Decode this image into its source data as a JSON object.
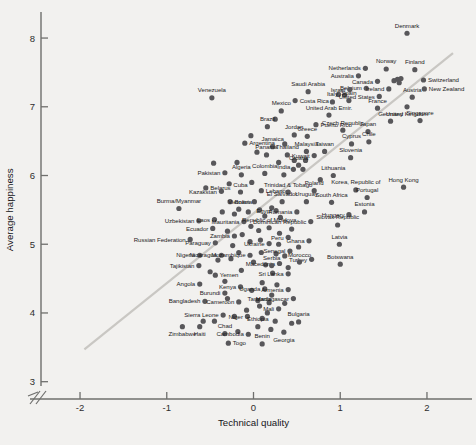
{
  "chart_data": {
    "type": "scatter",
    "title": "",
    "xlabel": "Technical quality",
    "ylabel": "Average happiness",
    "xlim": [
      -2.45,
      2.45
    ],
    "ylim": [
      2.85,
      8.35
    ],
    "xticks": [
      "-2",
      "-1",
      "0",
      "1",
      "2"
    ],
    "xtick_values": [
      -2,
      -1,
      0,
      1,
      2
    ],
    "yticks": [
      "3",
      "4",
      "5",
      "6",
      "7",
      "8"
    ],
    "ytick_values": [
      3,
      4,
      5,
      6,
      7,
      8
    ],
    "grid": false,
    "legend": null,
    "axis_break": "y-axis break near origin (double-slash)",
    "trendline": {
      "type": "linear",
      "x": [
        -1.95,
        2.3
      ],
      "y": [
        3.47,
        7.78
      ]
    },
    "marker_color": "#58575a",
    "trendline_color": "#c9c7c3",
    "points": [
      {
        "label": "Denmark",
        "x": 1.77,
        "y": 8.07,
        "lp": "above"
      },
      {
        "label": "Netherlands",
        "x": 1.29,
        "y": 7.56,
        "lp": "left"
      },
      {
        "label": "Norway",
        "x": 1.53,
        "y": 7.55,
        "lp": "above"
      },
      {
        "label": "Finland",
        "x": 1.86,
        "y": 7.54,
        "lp": "above"
      },
      {
        "label": "Australia",
        "x": 1.21,
        "y": 7.45,
        "lp": "left"
      },
      {
        "label": "Canada",
        "x": 1.43,
        "y": 7.37,
        "lp": "left"
      },
      {
        "label": "Switzerland",
        "x": 1.96,
        "y": 7.39,
        "lp": "right"
      },
      {
        "label": "Belgium",
        "x": 1.3,
        "y": 7.27,
        "lp": "left"
      },
      {
        "label": "Israel",
        "x": 1.11,
        "y": 7.25,
        "lp": "left"
      },
      {
        "label": "Ireland",
        "x": 1.56,
        "y": 7.26,
        "lp": "left"
      },
      {
        "label": "New Zealand",
        "x": 1.97,
        "y": 7.26,
        "lp": "right"
      },
      {
        "label": "United States",
        "x": 1.45,
        "y": 7.15,
        "lp": "left"
      },
      {
        "label": "Austria",
        "x": 1.83,
        "y": 7.14,
        "lp": "above"
      },
      {
        "label": "Spain",
        "x": 1.1,
        "y": 7.09,
        "lp": "above"
      },
      {
        "label": "Italy",
        "x": 0.91,
        "y": 7.07,
        "lp": "above"
      },
      {
        "label": "Costa Rica",
        "x": 0.48,
        "y": 7.09,
        "lp": "right"
      },
      {
        "label": "Venezuela",
        "x": -0.48,
        "y": 7.13,
        "lp": "above"
      },
      {
        "label": "Saudi Arabia",
        "x": 0.63,
        "y": 7.22,
        "lp": "above"
      },
      {
        "label": "France",
        "x": 1.43,
        "y": 6.98,
        "lp": "above"
      },
      {
        "label": "United Kingdom",
        "x": 1.77,
        "y": 7.0,
        "lp": "below"
      },
      {
        "label": "Mexico",
        "x": 0.32,
        "y": 6.94,
        "lp": "above"
      },
      {
        "label": "United Arab Emir.",
        "x": 0.87,
        "y": 6.88,
        "lp": "above"
      },
      {
        "label": "Germany",
        "x": 1.58,
        "y": 6.79,
        "lp": "above"
      },
      {
        "label": "Singapore",
        "x": 1.92,
        "y": 6.8,
        "lp": "above"
      },
      {
        "label": "Puerto Rico",
        "x": 0.72,
        "y": 6.74,
        "lp": "right"
      },
      {
        "label": "Brazil",
        "x": 0.16,
        "y": 6.71,
        "lp": "above"
      },
      {
        "label": "Czech Republic",
        "x": 1.03,
        "y": 6.66,
        "lp": "above"
      },
      {
        "label": "Japan",
        "x": 1.32,
        "y": 6.64,
        "lp": "above"
      },
      {
        "label": "Jordan",
        "x": 0.47,
        "y": 6.59,
        "lp": "above"
      },
      {
        "label": "Greece",
        "x": 0.62,
        "y": 6.57,
        "lp": "above"
      },
      {
        "label": "Chile",
        "x": 1.33,
        "y": 6.49,
        "lp": "above"
      },
      {
        "label": "Cyprus",
        "x": 1.13,
        "y": 6.46,
        "lp": "above"
      },
      {
        "label": "Argentina",
        "x": -0.1,
        "y": 6.47,
        "lp": "right"
      },
      {
        "label": "Jamaica",
        "x": 0.22,
        "y": 6.42,
        "lp": "above"
      },
      {
        "label": "Malaysia",
        "x": 0.61,
        "y": 6.35,
        "lp": "above"
      },
      {
        "label": "Taiwan",
        "x": 0.82,
        "y": 6.35,
        "lp": "above"
      },
      {
        "label": "Slovenia",
        "x": 1.12,
        "y": 6.26,
        "lp": "above"
      },
      {
        "label": "Panama",
        "x": 0.15,
        "y": 6.3,
        "lp": "above"
      },
      {
        "label": "Thailand",
        "x": 0.39,
        "y": 6.3,
        "lp": "above"
      },
      {
        "label": "Kuwait",
        "x": 0.7,
        "y": 6.29,
        "lp": "left"
      },
      {
        "label": "Croatia",
        "x": 0.52,
        "y": 6.15,
        "lp": "above"
      },
      {
        "label": "Pakistan",
        "x": -0.33,
        "y": 6.04,
        "lp": "left"
      },
      {
        "label": "India",
        "x": 0.35,
        "y": 6.01,
        "lp": "above"
      },
      {
        "label": "Colombia",
        "x": 0.13,
        "y": 6.03,
        "lp": "above"
      },
      {
        "label": "Algeria",
        "x": -0.14,
        "y": 6.01,
        "lp": "above"
      },
      {
        "label": "Lithuania",
        "x": 0.92,
        "y": 6.0,
        "lp": "above"
      },
      {
        "label": "Hong Kong",
        "x": 1.73,
        "y": 5.83,
        "lp": "above"
      },
      {
        "label": "Belarus",
        "x": -0.55,
        "y": 5.82,
        "lp": "right"
      },
      {
        "label": "Kazakstan",
        "x": -0.37,
        "y": 5.77,
        "lp": "left"
      },
      {
        "label": "Cuba",
        "x": -0.15,
        "y": 5.76,
        "lp": "above"
      },
      {
        "label": "Lebanon",
        "x": 0.09,
        "y": 5.78,
        "lp": "right"
      },
      {
        "label": "Trinidad & Tobago",
        "x": 0.4,
        "y": 5.76,
        "lp": "above"
      },
      {
        "label": "Poland",
        "x": 0.7,
        "y": 5.78,
        "lp": "above"
      },
      {
        "label": "Korea, Republic of",
        "x": 1.18,
        "y": 5.79,
        "lp": "above"
      },
      {
        "label": "Portugal",
        "x": 1.31,
        "y": 5.68,
        "lp": "above"
      },
      {
        "label": "Bolivia",
        "x": -0.27,
        "y": 5.62,
        "lp": "right"
      },
      {
        "label": "Vietnam",
        "x": 0.01,
        "y": 5.62,
        "lp": "left"
      },
      {
        "label": "El Salvador",
        "x": 0.33,
        "y": 5.62,
        "lp": "above"
      },
      {
        "label": "Uruguay",
        "x": 0.61,
        "y": 5.62,
        "lp": "above"
      },
      {
        "label": "South Africa",
        "x": 0.9,
        "y": 5.61,
        "lp": "above"
      },
      {
        "label": "Burma/Myanmar",
        "x": -0.86,
        "y": 5.52,
        "lp": "above"
      },
      {
        "label": "Egypt",
        "x": 0.26,
        "y": 5.49,
        "lp": "left"
      },
      {
        "label": "Romania",
        "x": 0.5,
        "y": 5.47,
        "lp": "left"
      },
      {
        "label": "Estonia",
        "x": 1.28,
        "y": 5.47,
        "lp": "above"
      },
      {
        "label": "Hungary",
        "x": 1.1,
        "y": 5.43,
        "lp": "left"
      },
      {
        "label": "Uzbekistan",
        "x": -0.63,
        "y": 5.34,
        "lp": "left"
      },
      {
        "label": "Laos",
        "x": -0.45,
        "y": 5.36,
        "lp": "left"
      },
      {
        "label": "Mauritania",
        "x": -0.11,
        "y": 5.33,
        "lp": "left"
      },
      {
        "label": "Dominican Republic",
        "x": 0.66,
        "y": 5.33,
        "lp": "left"
      },
      {
        "label": "Slovak Republic",
        "x": 0.97,
        "y": 5.28,
        "lp": "above"
      },
      {
        "label": "Ecuador",
        "x": -0.47,
        "y": 5.23,
        "lp": "left"
      },
      {
        "label": "Republic of Moldova",
        "x": 0.18,
        "y": 5.24,
        "lp": "above"
      },
      {
        "label": "Russian Federation",
        "x": -0.73,
        "y": 5.07,
        "lp": "left"
      },
      {
        "label": "Zambia",
        "x": -0.22,
        "y": 5.12,
        "lp": "left"
      },
      {
        "label": "Peru",
        "x": 0.4,
        "y": 5.1,
        "lp": "left"
      },
      {
        "label": "Ghana",
        "x": 0.64,
        "y": 5.05,
        "lp": "left"
      },
      {
        "label": "Latvia",
        "x": 0.99,
        "y": 5.0,
        "lp": "above"
      },
      {
        "label": "Paraguay",
        "x": -0.44,
        "y": 5.02,
        "lp": "left"
      },
      {
        "label": "Ukraine",
        "x": 0.18,
        "y": 5.01,
        "lp": "left"
      },
      {
        "label": "Senegal",
        "x": 0.42,
        "y": 4.9,
        "lp": "left"
      },
      {
        "label": "Nigeria",
        "x": -0.62,
        "y": 4.84,
        "lp": "left"
      },
      {
        "label": "Nicaragua",
        "x": -0.37,
        "y": 4.84,
        "lp": "left"
      },
      {
        "label": "Mozambique",
        "x": -0.04,
        "y": 4.84,
        "lp": "left"
      },
      {
        "label": "Turkey",
        "x": 0.67,
        "y": 4.78,
        "lp": "left"
      },
      {
        "label": "Macedonia",
        "x": 0.3,
        "y": 4.72,
        "lp": "left"
      },
      {
        "label": "Morocco",
        "x": 0.53,
        "y": 4.74,
        "lp": "above"
      },
      {
        "label": "Botswana",
        "x": 1.0,
        "y": 4.71,
        "lp": "above"
      },
      {
        "label": "Tajikistan",
        "x": -0.63,
        "y": 4.69,
        "lp": "left"
      },
      {
        "label": "Serbia",
        "x": 0.21,
        "y": 4.69,
        "lp": "above"
      },
      {
        "label": "Yemen",
        "x": -0.44,
        "y": 4.55,
        "lp": "right"
      },
      {
        "label": "Sri Lanka",
        "x": 0.4,
        "y": 4.57,
        "lp": "left"
      },
      {
        "label": "Angola",
        "x": -0.62,
        "y": 4.42,
        "lp": "left"
      },
      {
        "label": "Kenya",
        "x": -0.15,
        "y": 4.38,
        "lp": "left"
      },
      {
        "label": "Uganda",
        "x": 0.13,
        "y": 4.35,
        "lp": "left"
      },
      {
        "label": "Armenia",
        "x": 0.4,
        "y": 4.34,
        "lp": "left"
      },
      {
        "label": "Burundi",
        "x": -0.33,
        "y": 4.29,
        "lp": "left"
      },
      {
        "label": "Madagascar",
        "x": 0.46,
        "y": 4.21,
        "lp": "left"
      },
      {
        "label": "Bangladesh",
        "x": -0.56,
        "y": 4.17,
        "lp": "left"
      },
      {
        "label": "Cameroon",
        "x": -0.17,
        "y": 4.16,
        "lp": "left"
      },
      {
        "label": "Tanzania",
        "x": 0.07,
        "y": 4.1,
        "lp": "above"
      },
      {
        "label": "Mali",
        "x": 0.29,
        "y": 4.06,
        "lp": "left"
      },
      {
        "label": "Sierra Leone",
        "x": -0.35,
        "y": 3.97,
        "lp": "left"
      },
      {
        "label": "Niger",
        "x": -0.07,
        "y": 3.95,
        "lp": "left"
      },
      {
        "label": "Bulgaria",
        "x": 0.52,
        "y": 3.87,
        "lp": "above"
      },
      {
        "label": "Zimbabwe",
        "x": -0.82,
        "y": 3.8,
        "lp": "below"
      },
      {
        "label": "Haiti",
        "x": -0.62,
        "y": 3.8,
        "lp": "below"
      },
      {
        "label": "Ethiopia",
        "x": 0.05,
        "y": 3.8,
        "lp": "above"
      },
      {
        "label": "Chad",
        "x": -0.33,
        "y": 3.7,
        "lp": "above"
      },
      {
        "label": "Cambodia",
        "x": -0.06,
        "y": 3.69,
        "lp": "left"
      },
      {
        "label": "Georgia",
        "x": 0.35,
        "y": 3.72,
        "lp": "below"
      },
      {
        "label": "Togo",
        "x": -0.29,
        "y": 3.56,
        "lp": "right"
      },
      {
        "label": "Benin",
        "x": 0.1,
        "y": 3.55,
        "lp": "above"
      }
    ],
    "extra_points": [
      {
        "x": 1.66,
        "y": 7.4
      },
      {
        "x": 1.7,
        "y": 7.41
      },
      {
        "x": 1.62,
        "y": 7.38
      },
      {
        "x": 1.68,
        "y": 7.35
      },
      {
        "x": 0.98,
        "y": 7.18
      },
      {
        "x": 1.05,
        "y": 7.17
      },
      {
        "x": 0.25,
        "y": 6.82
      },
      {
        "x": -0.03,
        "y": 6.58
      },
      {
        "x": 0.36,
        "y": 6.46
      },
      {
        "x": 0.04,
        "y": 6.34
      },
      {
        "x": 0.47,
        "y": 6.22
      },
      {
        "x": 0.6,
        "y": 6.22
      },
      {
        "x": 0.29,
        "y": 6.19
      },
      {
        "x": -0.19,
        "y": 6.19
      },
      {
        "x": 0.46,
        "y": 6.09
      },
      {
        "x": 0.57,
        "y": 6.09
      },
      {
        "x": -0.46,
        "y": 6.18
      },
      {
        "x": 0.77,
        "y": 5.94
      },
      {
        "x": -0.02,
        "y": 5.9
      },
      {
        "x": -0.28,
        "y": 5.88
      },
      {
        "x": 0.21,
        "y": 5.53
      },
      {
        "x": 0.07,
        "y": 5.5
      },
      {
        "x": -0.06,
        "y": 5.47
      },
      {
        "x": -0.17,
        "y": 5.51
      },
      {
        "x": -0.36,
        "y": 5.47
      },
      {
        "x": -0.22,
        "y": 5.44
      },
      {
        "x": 0.13,
        "y": 5.41
      },
      {
        "x": 0.31,
        "y": 5.39
      },
      {
        "x": -0.03,
        "y": 5.26
      },
      {
        "x": 0.06,
        "y": 5.2
      },
      {
        "x": -0.3,
        "y": 5.19
      },
      {
        "x": -0.13,
        "y": 5.14
      },
      {
        "x": 0.3,
        "y": 5.16
      },
      {
        "x": 0.44,
        "y": 5.22
      },
      {
        "x": -0.04,
        "y": 5.04
      },
      {
        "x": 0.08,
        "y": 5.06
      },
      {
        "x": -0.24,
        "y": 4.98
      },
      {
        "x": 0.29,
        "y": 5.0
      },
      {
        "x": 0.52,
        "y": 4.96
      },
      {
        "x": -0.17,
        "y": 4.88
      },
      {
        "x": 0.09,
        "y": 4.88
      },
      {
        "x": 0.26,
        "y": 4.86
      },
      {
        "x": 0.36,
        "y": 4.83
      },
      {
        "x": -0.26,
        "y": 4.79
      },
      {
        "x": -0.41,
        "y": 4.77
      },
      {
        "x": 0.0,
        "y": 4.74
      },
      {
        "x": 0.14,
        "y": 4.7
      },
      {
        "x": 0.4,
        "y": 4.66
      },
      {
        "x": -0.14,
        "y": 4.62
      },
      {
        "x": -0.5,
        "y": 4.6
      },
      {
        "x": 0.22,
        "y": 4.58
      },
      {
        "x": -0.33,
        "y": 4.46
      },
      {
        "x": 0.1,
        "y": 4.44
      },
      {
        "x": 0.27,
        "y": 4.41
      },
      {
        "x": -0.02,
        "y": 4.33
      },
      {
        "x": 0.21,
        "y": 4.26
      },
      {
        "x": -0.3,
        "y": 4.21
      },
      {
        "x": 0.05,
        "y": 4.18
      },
      {
        "x": 0.18,
        "y": 4.15
      },
      {
        "x": 0.36,
        "y": 4.14
      },
      {
        "x": -0.08,
        "y": 4.04
      },
      {
        "x": 0.16,
        "y": 4.0
      },
      {
        "x": -0.22,
        "y": 3.95
      },
      {
        "x": 0.1,
        "y": 3.92
      },
      {
        "x": 0.25,
        "y": 3.88
      },
      {
        "x": -0.45,
        "y": 3.88
      },
      {
        "x": -0.58,
        "y": 3.88
      },
      {
        "x": 0.2,
        "y": 3.76
      },
      {
        "x": -0.18,
        "y": 3.73
      },
      {
        "x": 0.44,
        "y": 3.85
      }
    ]
  }
}
